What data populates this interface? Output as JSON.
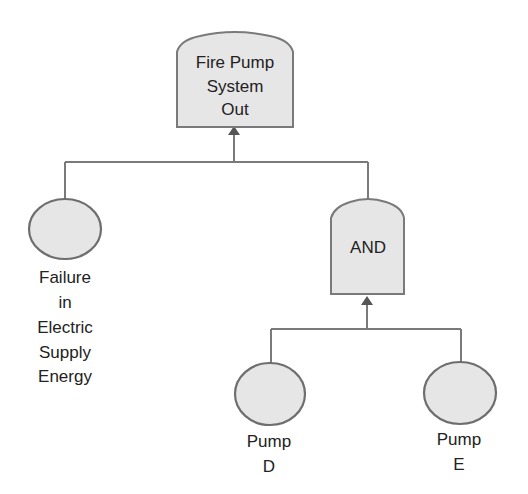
{
  "diagram": {
    "type": "fault-tree",
    "nodes": [
      {
        "id": "top",
        "kind": "top-event",
        "shape": "gate",
        "label_lines": [
          "Fire Pump",
          "System",
          "Out"
        ]
      },
      {
        "id": "electric",
        "kind": "basic-event",
        "shape": "circle",
        "label_lines": [
          "Failure",
          "in",
          "Electric",
          "Supply",
          "Energy"
        ]
      },
      {
        "id": "and",
        "kind": "and-gate",
        "shape": "gate",
        "label_lines": [
          "AND"
        ]
      },
      {
        "id": "pump_d",
        "kind": "basic-event",
        "shape": "circle",
        "label_lines": [
          "Pump",
          "D"
        ]
      },
      {
        "id": "pump_e",
        "kind": "basic-event",
        "shape": "circle",
        "label_lines": [
          "Pump",
          "E"
        ]
      }
    ],
    "edges": [
      {
        "from": "electric",
        "to": "top"
      },
      {
        "from": "and",
        "to": "top"
      },
      {
        "from": "pump_d",
        "to": "and"
      },
      {
        "from": "pump_e",
        "to": "and"
      }
    ],
    "colors": {
      "fill": "#e6e6e6",
      "stroke": "#7a7a7a",
      "text": "#222222",
      "arrow": "#555555"
    }
  }
}
